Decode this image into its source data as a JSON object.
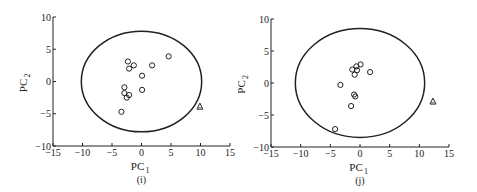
{
  "chart_data": [
    {
      "id": "i",
      "type": "scatter",
      "title": "",
      "caption": "(i)",
      "xlabel": "PC",
      "xlabel_sub": "1",
      "ylabel": "PC",
      "ylabel_sub": "2",
      "xlim": [
        -15,
        15
      ],
      "ylim": [
        -10,
        10
      ],
      "xticks": [
        -15,
        -10,
        -5,
        0,
        5,
        10,
        15
      ],
      "yticks": [
        -10,
        -5,
        0,
        5,
        10
      ],
      "grid": false,
      "ellipse": {
        "cx": 0,
        "cy": 0,
        "rx": 10.2,
        "ry": 7.8
      },
      "series": [
        {
          "name": "samples",
          "marker": "circle",
          "points": [
            {
              "x": -2.3,
              "y": 3.1
            },
            {
              "x": -2.1,
              "y": 2.0
            },
            {
              "x": -1.3,
              "y": 2.5
            },
            {
              "x": 1.8,
              "y": 2.5
            },
            {
              "x": 4.6,
              "y": 3.9
            },
            {
              "x": 0.1,
              "y": 0.9
            },
            {
              "x": 0.1,
              "y": -1.3
            },
            {
              "x": -2.9,
              "y": -0.9
            },
            {
              "x": -2.9,
              "y": -1.8
            },
            {
              "x": -2.1,
              "y": -2.1
            },
            {
              "x": -2.5,
              "y": -2.5
            },
            {
              "x": -3.4,
              "y": -4.7
            }
          ]
        },
        {
          "name": "outlier",
          "marker": "triangle",
          "points": [
            {
              "x": 9.9,
              "y": -3.9
            }
          ]
        }
      ]
    },
    {
      "id": "j",
      "type": "scatter",
      "title": "",
      "caption": "(j)",
      "xlabel": "PC",
      "xlabel_sub": "1",
      "ylabel": "PC",
      "ylabel_sub": "2",
      "xlim": [
        -15,
        15
      ],
      "ylim": [
        -10,
        10
      ],
      "xticks": [
        -15,
        -10,
        -5,
        0,
        5,
        10,
        15
      ],
      "yticks": [
        -10,
        -5,
        0,
        5,
        10
      ],
      "grid": false,
      "ellipse": {
        "cx": 0,
        "cy": 0,
        "rx": 10.9,
        "ry": 8.5
      },
      "series": [
        {
          "name": "samples",
          "marker": "circle",
          "points": [
            {
              "x": -1.3,
              "y": 2.1
            },
            {
              "x": -0.6,
              "y": 2.6
            },
            {
              "x": 0.1,
              "y": 2.9
            },
            {
              "x": -0.5,
              "y": 2.0
            },
            {
              "x": -0.9,
              "y": 1.3
            },
            {
              "x": 1.7,
              "y": 1.7
            },
            {
              "x": -3.3,
              "y": -0.3
            },
            {
              "x": -1.0,
              "y": -1.8
            },
            {
              "x": -0.8,
              "y": -2.1
            },
            {
              "x": -1.5,
              "y": -3.6
            },
            {
              "x": -4.2,
              "y": -7.2
            }
          ]
        },
        {
          "name": "outlier",
          "marker": "triangle",
          "points": [
            {
              "x": 12.3,
              "y": -2.9
            }
          ]
        }
      ]
    }
  ]
}
